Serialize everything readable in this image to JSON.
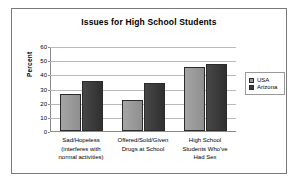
{
  "chart_data": {
    "type": "bar",
    "title": "Issues for High School Students",
    "xlabel": "",
    "ylabel": "Percent",
    "ylim": [
      0,
      60
    ],
    "yticks": [
      0,
      10,
      20,
      30,
      40,
      50,
      60
    ],
    "grid": true,
    "legend_position": "right",
    "categories": [
      "Sad/Hopeless (interferes with normal activities)",
      "Offered/Sold/Given Drugs at School",
      "High School Students Who've Had Sex"
    ],
    "category_lines": [
      [
        "Sad/Hopeless",
        "(interferes with",
        "normal activities)"
      ],
      [
        "Offered/Sold/Given",
        "Drugs at School",
        ""
      ],
      [
        "High School",
        "Students Who've",
        "Had Sex"
      ]
    ],
    "series": [
      {
        "name": "USA",
        "color": "#9a9a9a",
        "values": [
          26,
          22,
          45
        ]
      },
      {
        "name": "Arizona",
        "color": "#3a3a3a",
        "values": [
          35,
          34,
          47
        ]
      }
    ]
  },
  "legend": {
    "items": [
      {
        "label": "USA"
      },
      {
        "label": "Arizona"
      }
    ]
  }
}
